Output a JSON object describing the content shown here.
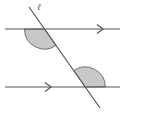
{
  "diagram": {
    "transversal_label": "ℓ",
    "colors": {
      "line": "#555555",
      "angle_fill": "#c8c8c8",
      "background": "#ffffff"
    },
    "lines": [
      {
        "name": "top-parallel-line",
        "y": 29,
        "x1": 5,
        "x2": 120,
        "arrow_x": 100
      },
      {
        "name": "bottom-parallel-line",
        "y": 87,
        "x1": 5,
        "x2": 120,
        "arrow_x": 48
      }
    ],
    "transversal": {
      "x1": 29,
      "y1": 7,
      "x2": 100,
      "y2": 108
    },
    "shaded_angles": [
      {
        "name": "top-angle",
        "position": "below-left of top intersection"
      },
      {
        "name": "bottom-angle",
        "position": "above-right of bottom intersection"
      }
    ]
  }
}
